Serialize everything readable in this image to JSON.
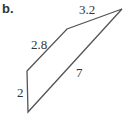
{
  "figure": {
    "label": "b.",
    "shape": "quadrilateral",
    "sides": [
      {
        "name": "left",
        "length": "2"
      },
      {
        "name": "upper-left",
        "length": "2.8"
      },
      {
        "name": "top",
        "length": "3.2"
      },
      {
        "name": "diagonal",
        "length": "7"
      }
    ],
    "stroke_color": "#555555"
  }
}
